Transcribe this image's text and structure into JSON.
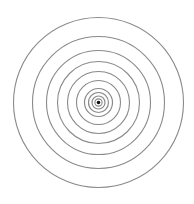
{
  "figure": {
    "background": "#ffffff",
    "stroke_color": "#8a8a8a",
    "dot_color": "#111111",
    "center": {
      "x": 98.5,
      "y": 102.5
    },
    "rings": [
      {
        "r": 85,
        "width": 1.1
      },
      {
        "r": 66,
        "width": 1.1
      },
      {
        "r": 52,
        "width": 1.1
      },
      {
        "r": 41,
        "width": 1.1
      },
      {
        "r": 31,
        "width": 1.1
      },
      {
        "r": 22,
        "width": 1.1
      },
      {
        "r": 14,
        "width": 1.2
      },
      {
        "r": 10,
        "width": 1.2
      },
      {
        "r": 6.5,
        "width": 1.2
      },
      {
        "r": 3.6,
        "width": 1.1
      }
    ],
    "center_dot": {
      "r": 1.8
    }
  }
}
